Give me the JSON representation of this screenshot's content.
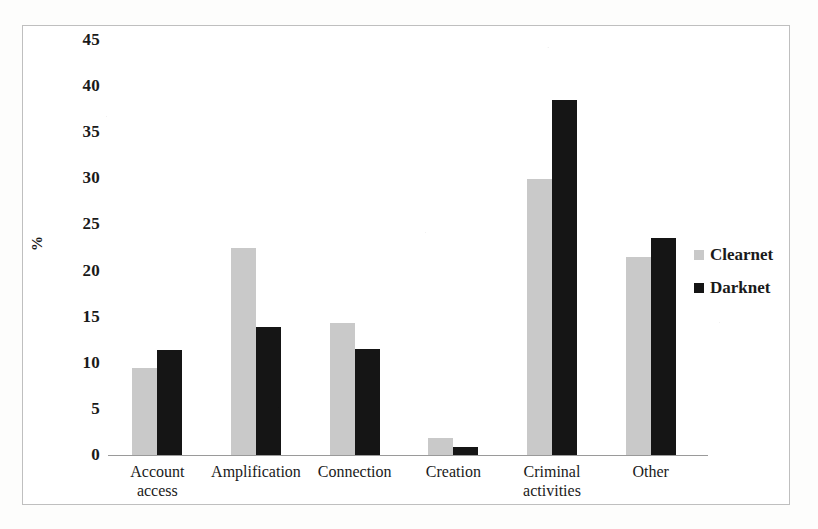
{
  "chart_data": {
    "type": "bar",
    "title": "",
    "xlabel": "",
    "ylabel": "%",
    "ylim": [
      0,
      45
    ],
    "ytick_step": 5,
    "yticks": [
      "45",
      "40",
      "35",
      "30",
      "25",
      "20",
      "15",
      "10",
      "5",
      "0"
    ],
    "grid": false,
    "legend_position": "right",
    "categories": [
      "Account\naccess",
      "Amplification",
      "Connection",
      "Creation",
      "Criminal\nactivities",
      "Other"
    ],
    "series": [
      {
        "name": "Clearnet",
        "color": "#c9c9c9",
        "values": [
          9.4,
          22.5,
          14.3,
          1.8,
          29.9,
          21.5
        ]
      },
      {
        "name": "Darknet",
        "color": "#151515",
        "values": [
          11.4,
          13.9,
          11.5,
          0.9,
          38.5,
          23.5
        ]
      }
    ]
  },
  "legend": {
    "items": [
      {
        "label": "Clearnet",
        "swatch": "clearnet-swatch-icon"
      },
      {
        "label": "Darknet",
        "swatch": "darknet-swatch-icon"
      }
    ]
  }
}
